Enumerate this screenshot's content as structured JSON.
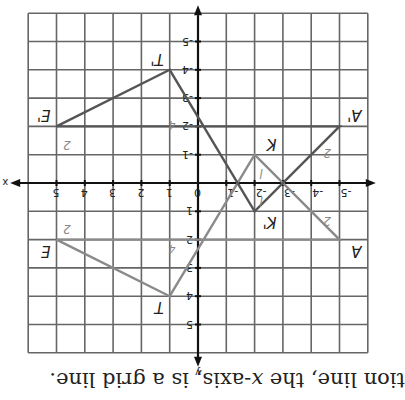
{
  "caption": {
    "prefix": "tion line, the ",
    "var": "x",
    "suffix": "-axis, is a grid line."
  },
  "axes": {
    "x_label": "x",
    "y_label": "y"
  },
  "x_ticks": [
    "-5",
    "-4",
    "-3",
    "-2",
    "-1",
    "0",
    "1",
    "2",
    "3",
    "4",
    "5"
  ],
  "y_ticks": [
    "-5",
    "-4",
    "-3",
    "-2",
    "-1",
    "1",
    "2",
    "3",
    "4",
    "5"
  ],
  "figure": {
    "original": {
      "name": "TEAK",
      "vertices": [
        {
          "label": "T",
          "x": 1,
          "y": 4
        },
        {
          "label": "E",
          "x": 5,
          "y": 2
        },
        {
          "label": "A",
          "x": -5,
          "y": 2
        },
        {
          "label": "K",
          "x": -2,
          "y": -1
        }
      ],
      "side_labels": [
        {
          "text": "2",
          "x": 4.5,
          "y": 1.5
        },
        {
          "text": "4",
          "x": 0.8,
          "y": 2.2
        },
        {
          "text": "2",
          "x": -4.7,
          "y": 1.2
        },
        {
          "text": "l",
          "x": -2.3,
          "y": -0.5
        }
      ],
      "color": "#8a8a8a"
    },
    "image": {
      "name": "T'E'A'K'",
      "vertices": [
        {
          "label": "T'",
          "x": 1,
          "y": -4
        },
        {
          "label": "E'",
          "x": 5,
          "y": -2
        },
        {
          "label": "A'",
          "x": -5,
          "y": -2
        },
        {
          "label": "K'",
          "x": -2,
          "y": 1
        }
      ],
      "side_labels": [
        {
          "text": "2",
          "x": 4.5,
          "y": -1.5
        },
        {
          "text": "4",
          "x": 0.8,
          "y": -2.2
        },
        {
          "text": "2",
          "x": -4.7,
          "y": -1.2
        },
        {
          "text": "l",
          "x": -2.3,
          "y": 0.5
        }
      ],
      "color": "#555555"
    }
  },
  "grid": {
    "xmin": -6,
    "xmax": 6,
    "ymin": -6,
    "ymax": 6,
    "line_color": "#666666"
  }
}
